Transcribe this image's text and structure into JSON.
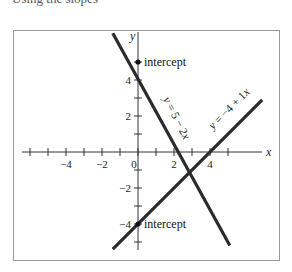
{
  "caption": "Using the slopes",
  "chart_data": {
    "type": "line",
    "title": "",
    "xlabel": "x",
    "ylabel": "y",
    "xlim": [
      -6.4,
      7.7
    ],
    "ylim": [
      -5.4,
      6.7
    ],
    "grid": false,
    "x_ticks": [
      -6,
      -5,
      -4,
      -3,
      -2,
      -1,
      0,
      1,
      2,
      3,
      4,
      5
    ],
    "x_tick_labels": [
      {
        "value": -4,
        "label": "−4"
      },
      {
        "value": -2,
        "label": "−2"
      },
      {
        "value": 0,
        "label": "0"
      },
      {
        "value": 2,
        "label": "2"
      },
      {
        "value": 4,
        "label": "4"
      }
    ],
    "y_ticks": [
      -5,
      -4,
      -3,
      -2,
      -1,
      1,
      2,
      3,
      4,
      5
    ],
    "y_tick_labels": [
      {
        "value": 4,
        "label": "4"
      },
      {
        "value": 2,
        "label": "2"
      },
      {
        "value": -2,
        "label": "−2"
      },
      {
        "value": -4,
        "label": "−4"
      }
    ],
    "series": [
      {
        "name": "y = 5 − 2x",
        "label_parts": [
          "y",
          " = 5 − 2",
          "x"
        ],
        "slope": -2,
        "intercept": 5,
        "x": [
          -1.4,
          5.1
        ],
        "y": [
          6.6,
          -5.2
        ]
      },
      {
        "name": "y = −4 + 1x",
        "label_parts": [
          "y",
          " = −4 + 1",
          "x"
        ],
        "slope": 1,
        "intercept": -4,
        "x": [
          -1.4,
          6.9
        ],
        "y": [
          -5.4,
          2.9
        ]
      }
    ],
    "points": [
      {
        "x": 0,
        "y": 5,
        "label": "intercept"
      },
      {
        "x": 0,
        "y": -4,
        "label": "intercept"
      }
    ],
    "intersection": {
      "x": 3,
      "y": -1
    }
  }
}
